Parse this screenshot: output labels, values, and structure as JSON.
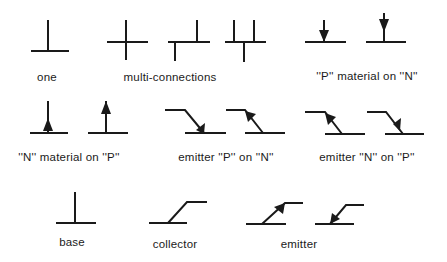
{
  "colors": {
    "stroke": "#1a1a1a",
    "background": "#ffffff"
  },
  "groups": [
    {
      "id": "one",
      "label": "one",
      "symbols": [
        "single-connection"
      ]
    },
    {
      "id": "multi",
      "label": "multi-connections",
      "symbols": [
        "cross-connection",
        "offset-t-connection",
        "double-t-connection"
      ]
    },
    {
      "id": "p-on-n",
      "label": "''P'' material on ''N''",
      "symbols": [
        "arrow-down-at-junction",
        "arrow-down-at-top"
      ]
    },
    {
      "id": "n-on-p",
      "label": "''N'' material on ''P''",
      "symbols": [
        "arrow-up-at-junction",
        "arrow-up-at-top"
      ]
    },
    {
      "id": "emitter-p-on-n",
      "label": "emitter ''P'' on ''N''",
      "symbols": [
        "emitter-arrow-in-near-junction",
        "emitter-arrow-in-near-bend"
      ]
    },
    {
      "id": "emitter-n-on-p",
      "label": "emitter ''N'' on ''P''",
      "symbols": [
        "emitter-arrow-out-near-junction",
        "emitter-arrow-out-near-bend"
      ]
    },
    {
      "id": "base",
      "label": "base",
      "symbols": [
        "base-lead"
      ]
    },
    {
      "id": "collector",
      "label": "collector",
      "symbols": [
        "collector-lead"
      ]
    },
    {
      "id": "emitter",
      "label": "emitter",
      "symbols": [
        "emitter-arrow-out",
        "emitter-arrow-in"
      ]
    }
  ]
}
